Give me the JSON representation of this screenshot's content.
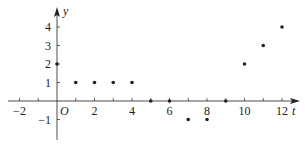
{
  "chart_data": {
    "type": "scatter",
    "title": "",
    "xlabel": "t",
    "ylabel": "y",
    "origin_label": "O",
    "xlim": [
      -3,
      13
    ],
    "ylim": [
      -1.8,
      4.8
    ],
    "x_ticks": [
      -2,
      -1,
      1,
      2,
      3,
      4,
      5,
      6,
      7,
      8,
      9,
      10,
      11,
      12
    ],
    "x_tick_labels": [
      "-2",
      "2",
      "4",
      "6",
      "8",
      "10",
      "12"
    ],
    "x_tick_label_values": [
      -2,
      2,
      4,
      6,
      8,
      10,
      12
    ],
    "y_ticks": [
      -1,
      1,
      2,
      3,
      4
    ],
    "y_tick_labels": [
      "-1",
      "1",
      "2",
      "3",
      "4"
    ],
    "y_tick_label_values": [
      -1,
      1,
      2,
      3,
      4
    ],
    "grid": false,
    "legend": null,
    "series": [
      {
        "name": "points",
        "x": [
          0,
          1,
          2,
          3,
          4,
          5,
          6,
          7,
          8,
          9,
          10,
          11,
          12
        ],
        "y": [
          2,
          1,
          1,
          1,
          1,
          0,
          0,
          -1,
          -1,
          0,
          2,
          3,
          4
        ]
      }
    ],
    "color": "#222222"
  }
}
